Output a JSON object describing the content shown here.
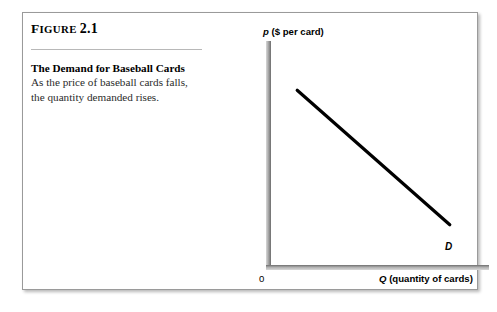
{
  "figure": {
    "label_lead": "F",
    "label_rest": "IGURE",
    "number": "2.1",
    "title": "The Demand for Baseball Cards",
    "body": "As the price of baseball cards falls, the quantity demanded rises."
  },
  "chart_data": {
    "type": "line",
    "title": "The Demand for Baseball Cards",
    "xlabel_var": "Q",
    "xlabel_rest": "(quantity of cards)",
    "ylabel_var": "p",
    "ylabel_rest": "($ per card)",
    "origin_label": "0",
    "series": [
      {
        "name": "D",
        "label": "D",
        "points": [
          {
            "x": 0.12,
            "y": 0.78
          },
          {
            "x": 0.82,
            "y": 0.18
          }
        ]
      }
    ],
    "xlim": [
      0,
      1
    ],
    "ylim": [
      0,
      1
    ],
    "grid": false,
    "legend": "inline-curve-label",
    "line_color": "#000000",
    "axis_color": "#808080",
    "annotation": "Downward sloping straight-line demand curve labeled D"
  }
}
